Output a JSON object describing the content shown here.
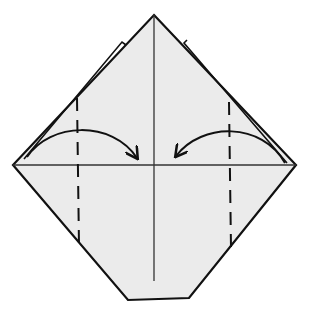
{
  "diagram": {
    "type": "origami-fold-step",
    "colors": {
      "background": "#ffffff",
      "paper": "#ebebeb",
      "stroke": "#111111",
      "crease": "#333333"
    },
    "shape": {
      "points": [
        [
          154,
          15
        ],
        [
          296,
          165
        ],
        [
          189,
          298
        ],
        [
          128,
          300
        ],
        [
          13,
          165
        ]
      ]
    },
    "creases": [
      {
        "name": "vertical-center-crease",
        "x1": 154,
        "y1": 15,
        "x2": 154,
        "y2": 281
      },
      {
        "name": "horizontal-center-crease",
        "x1": 13,
        "y1": 165,
        "x2": 296,
        "y2": 165
      }
    ],
    "valley_folds": [
      {
        "name": "left-valley-fold-line",
        "x": 77,
        "y1": 98,
        "y2": 246
      },
      {
        "name": "right-valley-fold-line",
        "x": 230,
        "y1": 102,
        "y2": 248
      }
    ],
    "arrows": [
      {
        "name": "left-fold-arrow",
        "path": "M27,157 C50,122 110,120 137,159",
        "direction": "right"
      },
      {
        "name": "right-fold-arrow",
        "path": "M285,164 C260,122 200,122 176,156",
        "direction": "left"
      }
    ],
    "flap_edges": [
      {
        "name": "left-flap-edge",
        "path": "M20,160 L123,42 L126,45"
      },
      {
        "name": "right-flap-edge",
        "path": "M286,163 L183,42 L186,40"
      }
    ]
  }
}
